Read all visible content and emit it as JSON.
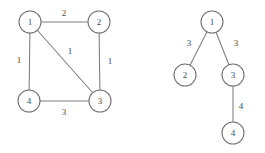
{
  "figure": {
    "background_color": "#ffffff",
    "stroke_color": "#7d7d7d",
    "text_color": "#4a4a4a",
    "node_fill": "#ffffff",
    "node_radius": 11
  },
  "chart_data": {
    "type": "diagram",
    "subtype": "node-link-graph",
    "title": "",
    "panels": [
      {
        "name": "weighted-undirected-graph",
        "layout": "square",
        "nodes": [
          {
            "id": "n1",
            "label": "1",
            "x": 30,
            "y": 22
          },
          {
            "id": "n2",
            "label": "2",
            "x": 99,
            "y": 22
          },
          {
            "id": "n3",
            "label": "3",
            "x": 100,
            "y": 101
          },
          {
            "id": "n4",
            "label": "4",
            "x": 29,
            "y": 101
          }
        ],
        "edges": [
          {
            "from": "n1",
            "to": "n2",
            "weight": "2",
            "label_x": 64,
            "label_y": 13
          },
          {
            "from": "n1",
            "to": "n4",
            "weight": "1",
            "label_x": 19,
            "label_y": 60
          },
          {
            "from": "n1",
            "to": "n3",
            "weight": "1",
            "label_x": 70,
            "label_y": 51
          },
          {
            "from": "n2",
            "to": "n3",
            "weight": "1",
            "label_x": 110,
            "label_y": 61
          },
          {
            "from": "n4",
            "to": "n3",
            "weight": "3",
            "label_x": 64,
            "label_y": 112
          }
        ]
      },
      {
        "name": "spanning-tree",
        "layout": "rooted-tree",
        "nodes": [
          {
            "id": "t1",
            "label": "1",
            "x": 212,
            "y": 22
          },
          {
            "id": "t2",
            "label": "2",
            "x": 185,
            "y": 75
          },
          {
            "id": "t3",
            "label": "3",
            "x": 233,
            "y": 75
          },
          {
            "id": "t4",
            "label": "4",
            "x": 233,
            "y": 133
          }
        ],
        "edges": [
          {
            "from": "t1",
            "to": "t2",
            "weight": "3",
            "label_x": 189,
            "label_y": 43
          },
          {
            "from": "t1",
            "to": "t3",
            "weight": "3",
            "label_x": 236,
            "label_y": 43
          },
          {
            "from": "t3",
            "to": "t4",
            "weight": "4",
            "label_x": 241,
            "label_y": 106
          }
        ]
      }
    ]
  }
}
